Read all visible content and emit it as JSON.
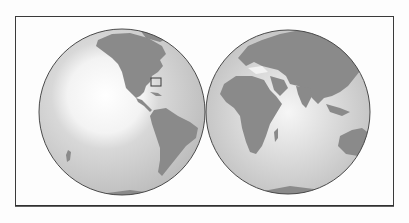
{
  "map": {
    "title": "",
    "projection": "orthographic-two-hemispheres",
    "hemispheres": [
      {
        "name": "Western Hemisphere",
        "cx": 122,
        "cy": 112,
        "r": 83,
        "visible_regions": [
          "North America",
          "Central America",
          "South America",
          "Pacific Ocean",
          "Antarctica"
        ]
      },
      {
        "name": "Eastern Hemisphere",
        "cx": 288,
        "cy": 112,
        "r": 82,
        "visible_regions": [
          "Europe",
          "Africa",
          "Asia",
          "Indian Ocean",
          "Australia",
          "Antarctica"
        ]
      }
    ],
    "marker": {
      "type": "rectangle",
      "location": "Florida / Bahamas",
      "x": 151,
      "y": 78,
      "w": 10,
      "h": 8
    },
    "colors": {
      "land": "#8a8a8a",
      "ocean": "#c9c9c9",
      "ocean_highlight": "#ffffff",
      "outline": "#4a4a4a",
      "frame": "#3a3a3a",
      "background": "#fdfdfd"
    }
  }
}
